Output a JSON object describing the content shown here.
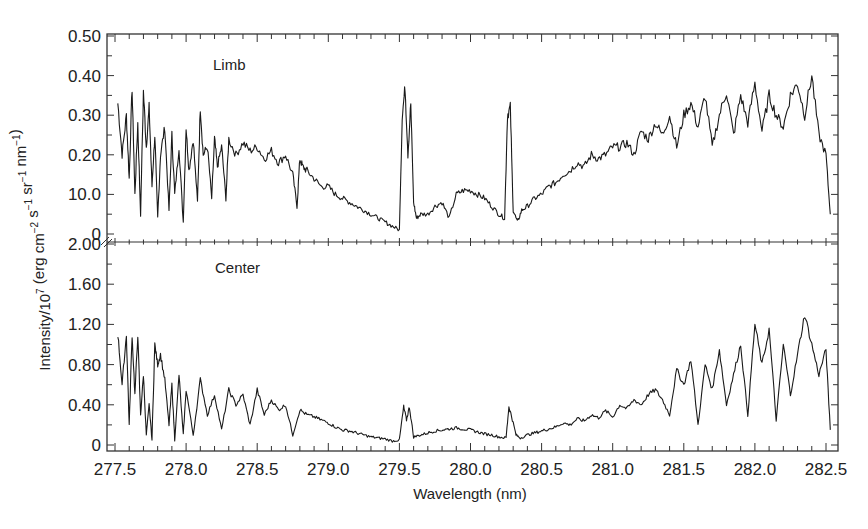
{
  "chart_data": {
    "type": "line",
    "title": "",
    "xlabel": "Wavelength (nm)",
    "ylabel": "Intensity/10⁷ (erg cm⁻² s⁻¹ sr⁻¹ nm⁻¹)",
    "xlim": [
      277.5,
      282.55
    ],
    "x_ticks": [
      "277.5",
      "278.0",
      "278.5",
      "279.0",
      "279.5",
      "280.0",
      "280.5",
      "281.0",
      "281.5",
      "282.0",
      "282.5"
    ],
    "grid": false,
    "legend": "none",
    "panels": [
      {
        "name": "Limb",
        "label": "Limb",
        "ylim": [
          0,
          0.5
        ],
        "y_ticks": [
          "0",
          "10.0",
          "0.20",
          "0.30",
          "0.40",
          "0.50"
        ],
        "y_tick_values": [
          0,
          0.1,
          0.2,
          0.3,
          0.4,
          0.5
        ],
        "series": [
          {
            "name": "Limb spectrum",
            "x": [
              277.52,
              277.55,
              277.58,
              277.6,
              277.62,
              277.64,
              277.66,
              277.68,
              277.7,
              277.72,
              277.74,
              277.76,
              277.78,
              277.8,
              277.82,
              277.85,
              277.88,
              277.9,
              277.92,
              277.95,
              277.98,
              278.0,
              278.02,
              278.05,
              278.08,
              278.1,
              278.12,
              278.15,
              278.18,
              278.2,
              278.22,
              278.25,
              278.28,
              278.3,
              278.35,
              278.4,
              278.45,
              278.5,
              278.55,
              278.6,
              278.65,
              278.7,
              278.75,
              278.78,
              278.8,
              278.82,
              278.85,
              278.9,
              278.95,
              279.0,
              279.05,
              279.1,
              279.15,
              279.2,
              279.25,
              279.3,
              279.35,
              279.4,
              279.45,
              279.5,
              279.52,
              279.54,
              279.56,
              279.58,
              279.6,
              279.62,
              279.65,
              279.7,
              279.75,
              279.8,
              279.85,
              279.9,
              279.95,
              280.0,
              280.05,
              280.1,
              280.15,
              280.2,
              280.24,
              280.26,
              280.28,
              280.3,
              280.33,
              280.36,
              280.4,
              280.45,
              280.5,
              280.55,
              280.6,
              280.65,
              280.7,
              280.75,
              280.8,
              280.85,
              280.9,
              280.95,
              281.0,
              281.05,
              281.1,
              281.15,
              281.2,
              281.25,
              281.3,
              281.35,
              281.4,
              281.45,
              281.5,
              281.55,
              281.6,
              281.65,
              281.7,
              281.75,
              281.8,
              281.85,
              281.9,
              281.95,
              282.0,
              282.05,
              282.1,
              282.15,
              282.2,
              282.25,
              282.3,
              282.35,
              282.4,
              282.45,
              282.5,
              282.53
            ],
            "values": [
              0.33,
              0.2,
              0.3,
              0.14,
              0.37,
              0.1,
              0.28,
              0.05,
              0.36,
              0.22,
              0.32,
              0.12,
              0.25,
              0.04,
              0.2,
              0.27,
              0.06,
              0.25,
              0.1,
              0.22,
              0.03,
              0.27,
              0.16,
              0.24,
              0.08,
              0.32,
              0.2,
              0.22,
              0.09,
              0.24,
              0.17,
              0.22,
              0.09,
              0.24,
              0.2,
              0.23,
              0.21,
              0.22,
              0.19,
              0.21,
              0.18,
              0.2,
              0.15,
              0.07,
              0.19,
              0.17,
              0.16,
              0.14,
              0.12,
              0.12,
              0.1,
              0.09,
              0.08,
              0.07,
              0.06,
              0.05,
              0.04,
              0.03,
              0.02,
              0.01,
              0.3,
              0.37,
              0.2,
              0.33,
              0.08,
              0.04,
              0.05,
              0.05,
              0.07,
              0.08,
              0.04,
              0.1,
              0.11,
              0.11,
              0.1,
              0.09,
              0.07,
              0.05,
              0.04,
              0.3,
              0.32,
              0.06,
              0.03,
              0.06,
              0.07,
              0.09,
              0.1,
              0.12,
              0.13,
              0.15,
              0.16,
              0.18,
              0.17,
              0.2,
              0.19,
              0.2,
              0.22,
              0.22,
              0.23,
              0.2,
              0.26,
              0.24,
              0.28,
              0.25,
              0.3,
              0.22,
              0.3,
              0.33,
              0.27,
              0.35,
              0.22,
              0.3,
              0.36,
              0.25,
              0.35,
              0.28,
              0.38,
              0.26,
              0.35,
              0.3,
              0.27,
              0.35,
              0.38,
              0.3,
              0.4,
              0.25,
              0.2,
              0.05
            ]
          }
        ]
      },
      {
        "name": "Center",
        "label": "Center",
        "ylim": [
          0,
          2.0
        ],
        "y_ticks": [
          "0",
          "0.40",
          "0.80",
          "1.20",
          "1.60",
          "2.00"
        ],
        "y_tick_values": [
          0,
          0.4,
          0.8,
          1.2,
          1.6,
          2.0
        ],
        "series": [
          {
            "name": "Center spectrum",
            "x": [
              277.52,
              277.55,
              277.58,
              277.6,
              277.62,
              277.64,
              277.66,
              277.68,
              277.7,
              277.72,
              277.74,
              277.76,
              277.78,
              277.8,
              277.82,
              277.85,
              277.88,
              277.9,
              277.92,
              277.95,
              277.98,
              278.0,
              278.05,
              278.1,
              278.15,
              278.2,
              278.25,
              278.3,
              278.35,
              278.4,
              278.45,
              278.5,
              278.55,
              278.6,
              278.65,
              278.7,
              278.75,
              278.8,
              278.85,
              278.9,
              278.95,
              279.0,
              279.05,
              279.1,
              279.15,
              279.2,
              279.25,
              279.3,
              279.35,
              279.4,
              279.45,
              279.5,
              279.53,
              279.55,
              279.57,
              279.6,
              279.65,
              279.7,
              279.75,
              279.8,
              279.85,
              279.9,
              279.95,
              280.0,
              280.05,
              280.1,
              280.15,
              280.2,
              280.25,
              280.27,
              280.29,
              280.32,
              280.35,
              280.4,
              280.45,
              280.5,
              280.55,
              280.6,
              280.65,
              280.7,
              280.75,
              280.8,
              280.85,
              280.9,
              280.95,
              281.0,
              281.05,
              281.1,
              281.15,
              281.2,
              281.25,
              281.3,
              281.35,
              281.4,
              281.45,
              281.5,
              281.55,
              281.6,
              281.65,
              281.7,
              281.75,
              281.8,
              281.85,
              281.9,
              281.95,
              282.0,
              282.05,
              282.1,
              282.15,
              282.2,
              282.25,
              282.3,
              282.35,
              282.4,
              282.45,
              282.5,
              282.53
            ],
            "values": [
              1.1,
              0.6,
              1.1,
              0.2,
              1.1,
              0.5,
              1.1,
              0.3,
              0.7,
              0.1,
              0.4,
              0.05,
              1.0,
              0.8,
              0.9,
              0.65,
              0.2,
              0.6,
              0.05,
              0.7,
              0.1,
              0.55,
              0.1,
              0.65,
              0.3,
              0.5,
              0.15,
              0.55,
              0.4,
              0.5,
              0.2,
              0.55,
              0.3,
              0.45,
              0.35,
              0.4,
              0.1,
              0.35,
              0.3,
              0.28,
              0.25,
              0.22,
              0.18,
              0.15,
              0.14,
              0.12,
              0.1,
              0.08,
              0.07,
              0.06,
              0.04,
              0.05,
              0.38,
              0.25,
              0.38,
              0.08,
              0.1,
              0.12,
              0.14,
              0.15,
              0.16,
              0.17,
              0.16,
              0.15,
              0.13,
              0.11,
              0.1,
              0.08,
              0.07,
              0.38,
              0.28,
              0.1,
              0.07,
              0.1,
              0.12,
              0.14,
              0.16,
              0.18,
              0.22,
              0.2,
              0.26,
              0.24,
              0.3,
              0.27,
              0.34,
              0.28,
              0.4,
              0.36,
              0.45,
              0.4,
              0.5,
              0.55,
              0.45,
              0.3,
              0.75,
              0.6,
              0.85,
              0.2,
              0.8,
              0.55,
              0.95,
              0.4,
              0.7,
              1.0,
              0.3,
              1.2,
              0.8,
              1.15,
              0.25,
              1.0,
              0.5,
              0.9,
              1.3,
              1.0,
              0.7,
              0.95,
              0.15
            ]
          }
        ]
      }
    ]
  },
  "labels": {
    "limb": "Limb",
    "center": "Center",
    "xlabel": "Wavelength (nm)",
    "ylabel_main": "Intensity/10",
    "ylabel_exp": "7",
    "ylabel_units": " (erg cm",
    "ylabel_rest": "−2 s−1 sr−1 nm−1)"
  },
  "style": {
    "line_color": "#1a1a1a",
    "axis_color": "#333333",
    "background": "#ffffff"
  }
}
